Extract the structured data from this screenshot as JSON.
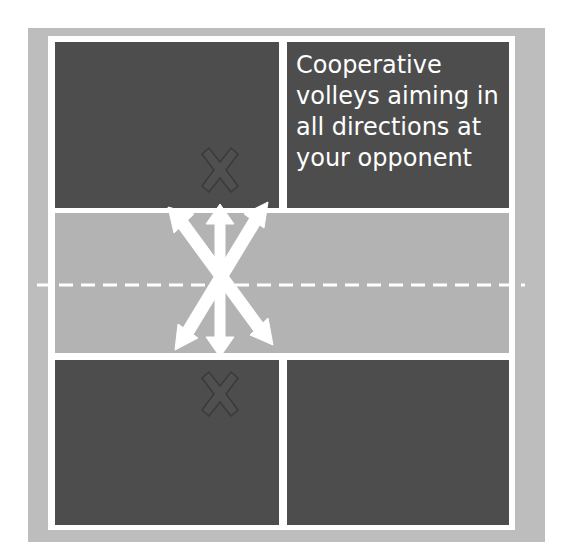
{
  "diagram": {
    "type": "volleyball-court-drill",
    "caption": "Cooperative\nvolleys aiming in\nall directions at\nyour opponent",
    "colors": {
      "outer_border": "#bdbdbd",
      "court_lines": "#ffffff",
      "back_zone": "#4d4d4d",
      "front_zone": "#b3b3b3",
      "arrow": "#ffffff",
      "player_marker": "#555555"
    },
    "elements": {
      "net_line": "dashed center line",
      "player_markers": [
        "X (top court)",
        "X (bottom court)"
      ],
      "arrows": [
        "up",
        "up-left",
        "up-right",
        "down",
        "down-left",
        "down-right"
      ]
    }
  }
}
